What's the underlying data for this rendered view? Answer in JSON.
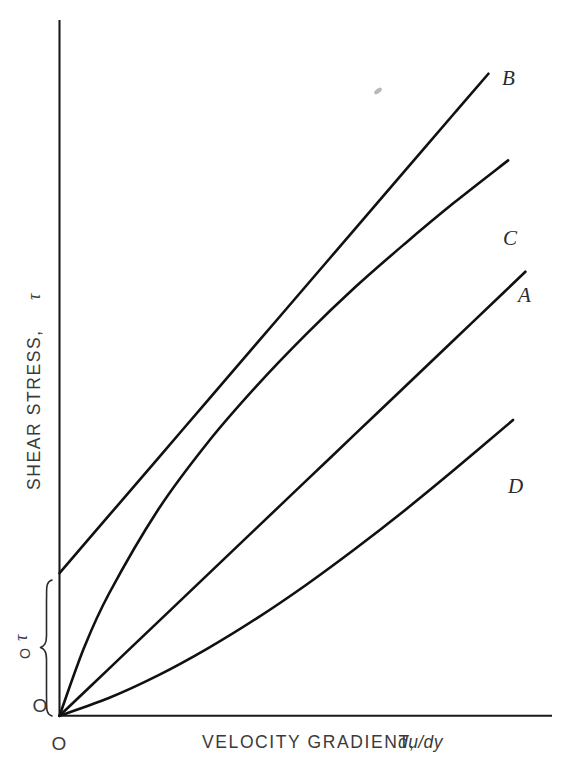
{
  "figure": {
    "background_color": "#ffffff",
    "ink_color": "#111111",
    "text_color": "#3a3a3a"
  },
  "axes": {
    "x_label_main": "VELOCITY GRADIENT,",
    "x_label_italic": "du/dy",
    "y_label_main": "SHEAR STRESS,",
    "y_label_symbol": "τ",
    "origin_x_label": "O",
    "origin_y_label": "O"
  },
  "annotations": {
    "yield_stress_symbol": "τ",
    "yield_stress_subscript": "O",
    "brace_name": "yield-stress-brace"
  },
  "curve_labels": {
    "a": "A",
    "b": "B",
    "c": "C",
    "d": "D"
  },
  "chart_data": {
    "type": "line",
    "title": "",
    "xlabel": "VELOCITY GRADIENT, du/dy",
    "ylabel": "SHEAR STRESS, τ",
    "grid": false,
    "legend": "inline-end-labels",
    "xlim": [
      0,
      1
    ],
    "ylim": [
      0,
      1
    ],
    "axis_ticks": false,
    "annotations": [
      {
        "name": "yield-stress",
        "text": "τO",
        "y_value": 0.205,
        "description": "Yield stress intercept of curve B on the shear-stress axis, marked by a brace from the origin up to the B intercept."
      }
    ],
    "series": [
      {
        "name": "A",
        "label": "A",
        "fluid_type": "Newtonian",
        "description": "Straight line through the origin; constant viscosity.",
        "x": [
          0.0,
          0.1,
          0.2,
          0.3,
          0.4,
          0.5,
          0.6,
          0.7,
          0.8,
          0.9,
          0.945
        ],
        "y": [
          0.0,
          0.0675,
          0.135,
          0.2025,
          0.27,
          0.3375,
          0.405,
          0.4725,
          0.54,
          0.6075,
          0.638
        ]
      },
      {
        "name": "B",
        "label": "B",
        "fluid_type": "Bingham plastic",
        "description": "Straight line with a positive shear-stress intercept at the yield stress tau-zero.",
        "x": [
          0.0,
          0.1,
          0.2,
          0.3,
          0.4,
          0.5,
          0.6,
          0.7,
          0.8,
          0.87
        ],
        "y": [
          0.205,
          0.2875,
          0.37,
          0.4525,
          0.535,
          0.6175,
          0.7,
          0.7825,
          0.865,
          0.9225
        ]
      },
      {
        "name": "C",
        "label": "C",
        "fluid_type": "Pseudoplastic",
        "description": "Concave-down curve through the origin; apparent viscosity decreases with shear rate.",
        "x": [
          0.0,
          0.05,
          0.1,
          0.2,
          0.3,
          0.4,
          0.5,
          0.6,
          0.7,
          0.8,
          0.91
        ],
        "y": [
          0.0,
          0.098,
          0.175,
          0.296,
          0.392,
          0.474,
          0.548,
          0.616,
          0.678,
          0.737,
          0.798
        ]
      },
      {
        "name": "D",
        "label": "D",
        "fluid_type": "Dilatant",
        "description": "Concave-up curve through the origin; apparent viscosity increases with shear rate.",
        "x": [
          0.0,
          0.1,
          0.2,
          0.3,
          0.4,
          0.5,
          0.6,
          0.7,
          0.8,
          0.92
        ],
        "y": [
          0.0,
          0.0255,
          0.058,
          0.0965,
          0.14,
          0.188,
          0.24,
          0.295,
          0.353,
          0.425
        ]
      }
    ]
  }
}
